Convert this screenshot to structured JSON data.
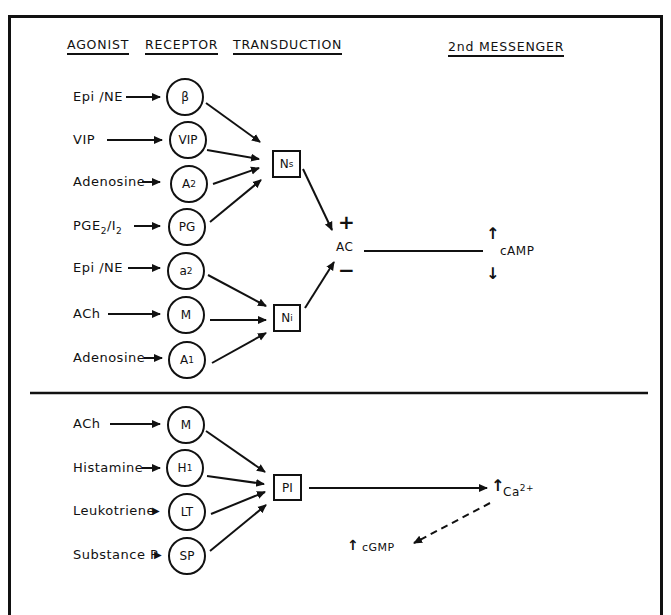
{
  "headers": {
    "agonist": "AGONIST",
    "receptor": "RECEPTOR",
    "transduction": "TRANSDUCTION",
    "second_messenger": "2nd MESSENGER"
  },
  "upper_panel": {
    "agonists": [
      "Epi /NE",
      "VIP",
      "Adenosine",
      "PGE",
      "Epi /NE",
      "ACh",
      "Adenosine"
    ],
    "pge_parts": {
      "main": "PGE",
      "sub1": "2",
      "mid": "/I",
      "sub2": "2"
    },
    "receptors": [
      {
        "label": "β",
        "sub": ""
      },
      {
        "label": "VIP",
        "sub": ""
      },
      {
        "label": "A",
        "sub": "2"
      },
      {
        "label": "PG",
        "sub": ""
      },
      {
        "label": "a",
        "sub": "2"
      },
      {
        "label": "M",
        "sub": ""
      },
      {
        "label": "A",
        "sub": "1"
      }
    ],
    "transducers": [
      {
        "label": "N",
        "sub": "s"
      },
      {
        "label": "N",
        "sub": "i"
      }
    ],
    "effector": "AC",
    "plus_sign": "+",
    "minus_sign": "−",
    "second_messenger": "cAMP",
    "up_arrow": "↑",
    "down_arrow": "↓"
  },
  "lower_panel": {
    "agonists": [
      "ACh",
      "Histamine",
      "Leukotriene",
      "Substance P"
    ],
    "receptors": [
      {
        "label": "M",
        "sub": ""
      },
      {
        "label": "H",
        "sub": "1"
      },
      {
        "label": "LT",
        "sub": ""
      },
      {
        "label": "SP",
        "sub": ""
      }
    ],
    "transducer": "PI",
    "calcium": {
      "label": "Ca",
      "sup": "2+"
    },
    "cgmp": "cGMP",
    "up_arrow": "↑"
  }
}
